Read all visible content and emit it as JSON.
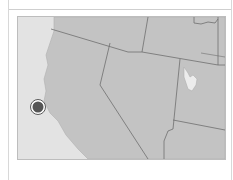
{
  "map": {
    "region": "Western United States",
    "colors": {
      "ocean": "#e3e3e3",
      "land": "#c3c3c3",
      "border": "#6e6e6e",
      "lake": "#ececec",
      "marker_fill": "#555555",
      "marker_ring": "#ffffff"
    },
    "marker": {
      "icon": "location-marker-icon",
      "x": 20,
      "y": 90
    }
  }
}
